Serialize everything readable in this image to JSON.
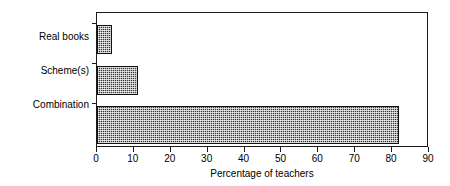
{
  "chart_data": {
    "type": "bar",
    "orientation": "horizontal",
    "title": "",
    "subtitle": "",
    "xlabel": "Percentage of teachers",
    "ylabel": "",
    "categories": [
      "Real books",
      "Scheme(s)",
      "Combination"
    ],
    "values": [
      4,
      11,
      82
    ],
    "series": [
      {
        "name": "Percentage of teachers",
        "values": [
          4,
          11,
          82
        ]
      }
    ],
    "xlim": [
      0,
      90
    ],
    "xticks": [
      0,
      10,
      20,
      30,
      40,
      50,
      60,
      70,
      80,
      90
    ],
    "xtick_labels": [
      "0",
      "10",
      "20",
      "30",
      "40",
      "50",
      "60",
      "70",
      "80",
      "90"
    ],
    "grid": false,
    "legend": false,
    "legend_position": "none",
    "annotations": [],
    "colors": {
      "bar_fill": "#3a3a3a",
      "bar_edge": "#111111",
      "axis": "#1a1a1a",
      "background": "#ffffff",
      "text": "#000000"
    }
  },
  "axis": {
    "x_title": "Percentage of teachers"
  }
}
